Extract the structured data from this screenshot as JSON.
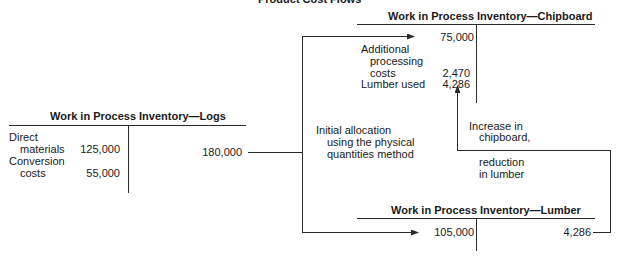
{
  "title": "Product Cost Flows",
  "accounts": {
    "logs": {
      "title": "Work in Process Inventory—Logs",
      "debits": [
        {
          "label_line1": "Direct",
          "label_line2": "materials",
          "value": "125,000"
        },
        {
          "label_line1": "Conversion",
          "label_line2": "costs",
          "value": "55,000"
        }
      ],
      "credits": [
        {
          "value": "180,000"
        }
      ]
    },
    "chipboard": {
      "title": "Work in Process Inventory—Chipboard",
      "debits": [
        {
          "value": "75,000"
        },
        {
          "label_line1": "Additional",
          "label_line2": "processing",
          "label_line3": "costs",
          "value": "2,470"
        },
        {
          "label_line1": "Lumber used",
          "value": "4,286"
        }
      ]
    },
    "lumber": {
      "title": "Work in Process Inventory—Lumber",
      "debits": [
        {
          "value": "105,000"
        }
      ],
      "credits": [
        {
          "value": "4,286"
        }
      ]
    }
  },
  "annotations": {
    "allocation": [
      "Initial allocation",
      "using the physical",
      "quantities method"
    ],
    "transfer_top": [
      "Increase in",
      "chipboard,"
    ],
    "transfer_bottom": [
      "reduction",
      "in lumber"
    ]
  },
  "colors": {
    "line": "#2a2a2a",
    "text": "#1a1a1a",
    "background": "#ffffff"
  }
}
